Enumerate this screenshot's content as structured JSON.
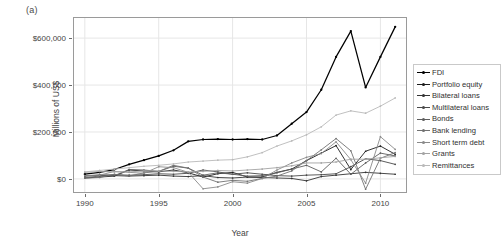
{
  "figure": {
    "panel_label": "(a)",
    "background": "#ffffff"
  },
  "legend": {
    "position": "right",
    "border_color": "#c9c9c9",
    "items": [
      {
        "label": "FDI",
        "color": "#000000"
      },
      {
        "label": "Portfolio equity",
        "color": "#1c1c1c"
      },
      {
        "label": "Bilateral loans",
        "color": "#333333"
      },
      {
        "label": "Multilateral loans",
        "color": "#4a4a4a"
      },
      {
        "label": "Bonds",
        "color": "#5e5e5e"
      },
      {
        "label": "Bank lending",
        "color": "#727272"
      },
      {
        "label": "Short term debt",
        "color": "#8a8a8a"
      },
      {
        "label": "Grants",
        "color": "#a3a3a3"
      },
      {
        "label": "Remittances",
        "color": "#b9b9b9"
      }
    ]
  },
  "chart_data": {
    "type": "line",
    "title": "",
    "xlabel": "Year",
    "ylabel": "Millions of US$",
    "xlim": [
      1989.2,
      2011.8
    ],
    "ylim": [
      -60000,
      690000
    ],
    "grid": true,
    "x": [
      1990,
      1991,
      1992,
      1993,
      1994,
      1995,
      1996,
      1997,
      1998,
      1999,
      2000,
      2001,
      2002,
      2003,
      2004,
      2005,
      2006,
      2007,
      2008,
      2009,
      2010,
      2011
    ],
    "xticks": [
      1990,
      1995,
      2000,
      2005,
      2010
    ],
    "xtick_labels": [
      "1990",
      "1995",
      "2000",
      "2005",
      "2010"
    ],
    "yticks": [
      0,
      200000,
      400000,
      600000
    ],
    "ytick_labels": [
      "$0",
      "$200,000",
      "$400,000",
      "$600,000"
    ],
    "legend_position": "right",
    "series": [
      {
        "name": "FDI",
        "color": "#000000",
        "values": [
          20000,
          28000,
          40000,
          62000,
          80000,
          98000,
          122000,
          160000,
          168000,
          170000,
          168000,
          170000,
          168000,
          185000,
          235000,
          285000,
          380000,
          520000,
          630000,
          390000,
          520000,
          648000
        ]
      },
      {
        "name": "Portfolio equity",
        "color": "#1c1c1c",
        "values": [
          4000,
          8000,
          12000,
          38000,
          34000,
          30000,
          38000,
          26000,
          8000,
          22000,
          28000,
          8000,
          8000,
          28000,
          42000,
          78000,
          110000,
          142000,
          40000,
          118000,
          140000,
          105000
        ]
      },
      {
        "name": "Bilateral loans",
        "color": "#333333",
        "values": [
          12000,
          16000,
          14000,
          12000,
          14000,
          16000,
          12000,
          10000,
          14000,
          6000,
          4000,
          8000,
          6000,
          4000,
          2000,
          -8000,
          10000,
          16000,
          22000,
          28000,
          24000,
          20000
        ]
      },
      {
        "name": "Multilateral loans",
        "color": "#4a4a4a",
        "values": [
          14000,
          16000,
          18000,
          16000,
          18000,
          22000,
          20000,
          24000,
          38000,
          30000,
          20000,
          26000,
          20000,
          14000,
          12000,
          16000,
          18000,
          22000,
          52000,
          86000,
          78000,
          62000
        ]
      },
      {
        "name": "Bonds",
        "color": "#5e5e5e",
        "values": [
          6000,
          12000,
          14000,
          40000,
          38000,
          32000,
          54000,
          46000,
          16000,
          26000,
          20000,
          12000,
          14000,
          26000,
          42000,
          58000,
          30000,
          88000,
          20000,
          68000,
          110000,
          98000
        ]
      },
      {
        "name": "Bank lending",
        "color": "#727272",
        "values": [
          3000,
          6000,
          20000,
          12000,
          26000,
          32000,
          58000,
          46000,
          8000,
          -14000,
          -6000,
          -10000,
          2000,
          12000,
          34000,
          78000,
          124000,
          172000,
          120000,
          -44000,
          88000,
          112000
        ]
      },
      {
        "name": "Short term debt",
        "color": "#8a8a8a",
        "values": [
          14000,
          16000,
          32000,
          28000,
          24000,
          52000,
          48000,
          28000,
          -42000,
          -34000,
          -12000,
          -18000,
          2000,
          38000,
          68000,
          92000,
          108000,
          158000,
          82000,
          -18000,
          180000,
          126000
        ]
      },
      {
        "name": "Grants",
        "color": "#a3a3a3",
        "values": [
          28000,
          32000,
          30000,
          30000,
          34000,
          34000,
          32000,
          30000,
          32000,
          36000,
          34000,
          38000,
          42000,
          48000,
          56000,
          68000,
          68000,
          72000,
          84000,
          84000,
          90000,
          96000
        ]
      },
      {
        "name": "Remittances",
        "color": "#b9b9b9",
        "values": [
          30000,
          36000,
          42000,
          48000,
          54000,
          58000,
          64000,
          72000,
          76000,
          80000,
          82000,
          94000,
          112000,
          140000,
          162000,
          188000,
          222000,
          272000,
          290000,
          280000,
          310000,
          345000
        ]
      }
    ]
  }
}
